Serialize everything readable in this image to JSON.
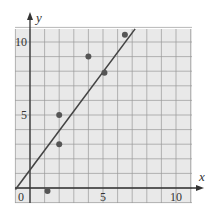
{
  "chart_data": {
    "type": "scatter",
    "title": "",
    "xlabel": "x",
    "ylabel": "y",
    "xlim": [
      -1,
      11.3
    ],
    "ylim": [
      -1,
      11.3
    ],
    "grid": true,
    "grid_step": 1,
    "legend": null,
    "x_ticks": [
      0,
      5,
      10
    ],
    "y_ticks": [
      5,
      10
    ],
    "x_tick_labels": [
      "0",
      "5",
      "10"
    ],
    "y_tick_labels": [
      "5",
      "10"
    ],
    "points": [
      {
        "x": 1.2,
        "y": -0.2
      },
      {
        "x": 2,
        "y": 3
      },
      {
        "x": 2,
        "y": 5
      },
      {
        "x": 4,
        "y": 9
      },
      {
        "x": 5.1,
        "y": 7.9
      },
      {
        "x": 6.5,
        "y": 10.5
      }
    ],
    "fit_line": {
      "x1": -1,
      "y1": -0.1,
      "x2": 7.2,
      "y2": 10.9,
      "slope": 1.33,
      "intercept": 1.2
    },
    "colors": {
      "background": "#e9e9e9",
      "grid": "#9a9a9a",
      "axis": "#333333",
      "points": "#555555",
      "line": "#444444"
    }
  }
}
